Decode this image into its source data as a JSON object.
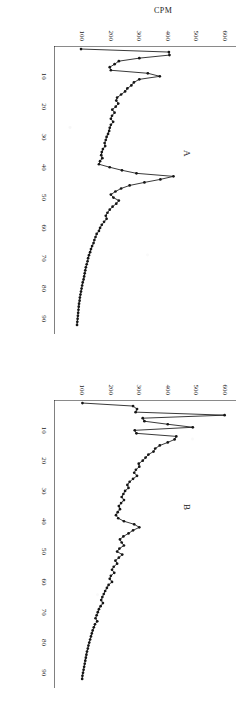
{
  "figure": {
    "background_color": "#ffffff",
    "ink_color": "#161616",
    "rotation_degrees": 90,
    "panel_letters": [
      "A",
      "B"
    ]
  },
  "chart_data": [
    {
      "type": "line",
      "title": "A",
      "panel_label": "A",
      "xlabel": "",
      "ylabel": "CPM",
      "xlim": [
        0,
        95
      ],
      "ylim": [
        0,
        640
      ],
      "xticks": [
        10,
        20,
        30,
        40,
        50,
        60,
        70,
        80,
        90
      ],
      "xticklabels": [
        "10",
        "20",
        "30",
        "40",
        "50",
        "60",
        "70",
        "80",
        "90"
      ],
      "yticks": [
        100,
        200,
        300,
        400,
        500,
        600
      ],
      "yticklabels": [
        "100",
        "200",
        "300",
        "400",
        "500",
        "600"
      ],
      "grid": false,
      "legend": false,
      "markers": "filled-circle",
      "x": [
        1,
        2,
        3,
        4,
        5,
        6,
        7,
        8,
        9,
        10,
        11,
        12,
        13,
        14,
        15,
        16,
        17,
        18,
        19,
        20,
        21,
        22,
        23,
        24,
        25,
        26,
        27,
        28,
        29,
        30,
        31,
        32,
        33,
        34,
        35,
        36,
        37,
        38,
        39,
        40,
        41,
        42,
        43,
        44,
        45,
        46,
        47,
        48,
        49,
        50,
        51,
        52,
        53,
        54,
        55,
        56,
        57,
        58,
        59,
        60,
        61,
        62,
        63,
        64,
        65,
        66,
        67,
        68,
        69,
        70,
        71,
        72,
        73,
        74,
        75,
        76,
        77,
        78,
        79,
        80,
        81,
        82,
        83,
        84,
        85,
        86,
        87,
        88,
        89,
        90,
        91,
        92
      ],
      "values": [
        95,
        404,
        406,
        300,
        228,
        213,
        196,
        200,
        330,
        372,
        300,
        281,
        272,
        258,
        250,
        236,
        222,
        219,
        226,
        217,
        205,
        213,
        204,
        200,
        208,
        200,
        196,
        194,
        190,
        185,
        182,
        178,
        180,
        172,
        168,
        166,
        170,
        162,
        158,
        196,
        239,
        290,
        420,
        374,
        318,
        266,
        236,
        216,
        200,
        209,
        228,
        219,
        206,
        196,
        188,
        182,
        185,
        176,
        168,
        162,
        158,
        150,
        146,
        142,
        139,
        134,
        130,
        127,
        123,
        120,
        118,
        115,
        112,
        110,
        108,
        106,
        104,
        101,
        99,
        97,
        95,
        93,
        91,
        90,
        88,
        87,
        86,
        85,
        84,
        83,
        82,
        81,
        80
      ]
    },
    {
      "type": "line",
      "title": "B",
      "panel_label": "B",
      "xlabel": "",
      "ylabel": "",
      "xlim": [
        0,
        95
      ],
      "ylim": [
        0,
        640
      ],
      "xticks": [
        10,
        20,
        30,
        40,
        50,
        60,
        70,
        80,
        90
      ],
      "xticklabels": [
        "10",
        "20",
        "30",
        "40",
        "50",
        "60",
        "70",
        "80",
        "90"
      ],
      "yticks": [
        100,
        200,
        300,
        400,
        500,
        600
      ],
      "yticklabels": [
        "100",
        "200",
        "300",
        "400",
        "500",
        "600"
      ],
      "grid": false,
      "legend": false,
      "markers": "filled-circle",
      "x": [
        1,
        2,
        3,
        4,
        5,
        6,
        7,
        8,
        9,
        10,
        11,
        12,
        13,
        14,
        15,
        16,
        17,
        18,
        19,
        20,
        21,
        22,
        23,
        24,
        25,
        26,
        27,
        28,
        29,
        30,
        31,
        32,
        33,
        34,
        35,
        36,
        37,
        38,
        39,
        40,
        41,
        42,
        43,
        44,
        45,
        46,
        47,
        48,
        49,
        50,
        51,
        52,
        53,
        54,
        55,
        56,
        57,
        58,
        59,
        60,
        61,
        62,
        63,
        64,
        65,
        66,
        67,
        68,
        69,
        70,
        71,
        72,
        73,
        74,
        75,
        76,
        77,
        78,
        79,
        80,
        81,
        82,
        83,
        84,
        85,
        86,
        87,
        88,
        89,
        90,
        91,
        92
      ],
      "values": [
        100,
        278,
        292,
        287,
        600,
        312,
        318,
        400,
        488,
        284,
        290,
        430,
        424,
        400,
        372,
        356,
        350,
        332,
        322,
        312,
        298,
        300,
        288,
        282,
        292,
        278,
        266,
        258,
        262,
        250,
        244,
        238,
        246,
        236,
        228,
        232,
        224,
        218,
        226,
        246,
        282,
        300,
        278,
        262,
        244,
        232,
        238,
        246,
        230,
        222,
        240,
        228,
        216,
        222,
        210,
        204,
        212,
        200,
        196,
        204,
        192,
        186,
        180,
        175,
        170,
        166,
        172,
        164,
        158,
        154,
        150,
        146,
        152,
        144,
        140,
        136,
        133,
        130,
        127,
        124,
        121,
        119,
        116,
        114,
        112,
        110,
        108,
        106,
        104,
        102,
        100,
        99
      ]
    }
  ]
}
